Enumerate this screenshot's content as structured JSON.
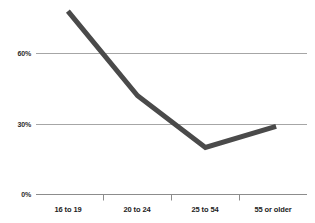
{
  "chart_data": {
    "type": "line",
    "title": "",
    "subtitle": "",
    "xlabel": "",
    "ylabel": "",
    "categories": [
      "16 to 19",
      "20 to 24",
      "25 to 54",
      "55 or older"
    ],
    "values": [
      78,
      42,
      20,
      29
    ],
    "series": [
      {
        "name": "",
        "values": [
          78,
          42,
          20,
          29
        ]
      }
    ],
    "ylim": [
      0,
      90
    ],
    "ytick_labels": [
      "0%",
      "30%",
      "60%"
    ],
    "ytick_values": [
      0,
      30,
      60
    ],
    "grid": true,
    "legend": "none",
    "annotations": []
  },
  "style": {
    "line_color": "#4a4a4a",
    "grid_color": "#a6a6a6",
    "axis_color": "#8c8c8c",
    "tick_color": "#8c8c8c",
    "label_color": "#1c1c1c",
    "background": "#ffffff"
  },
  "axis": {
    "y_labels": {
      "top": "60%",
      "middle": "30%",
      "bottom": "0%"
    },
    "x_labels": {
      "cat0": "16 to 19",
      "cat1": "20 to 24",
      "cat2": "25 to 54",
      "cat3": "55 or older"
    }
  }
}
